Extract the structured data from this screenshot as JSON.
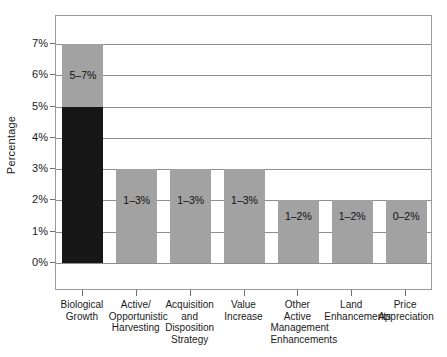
{
  "chart_data": {
    "type": "bar",
    "title": "",
    "subtitle": "",
    "xlabel": "",
    "ylabel": "Percentage",
    "ylim": [
      0,
      7
    ],
    "ytick_labels": [
      "0%",
      "1%",
      "2%",
      "3%",
      "4%",
      "5%",
      "6%",
      "7%"
    ],
    "ytick_values": [
      0,
      1,
      2,
      3,
      4,
      5,
      6,
      7
    ],
    "grid": true,
    "legend": "none",
    "stacked": true,
    "colors": {
      "light_gray": "#a2a2a2",
      "dark": "#171717",
      "gridline": "#8e8e8e",
      "frame": "#9a9a9a",
      "text": "#1a1a1a"
    },
    "categories": [
      "Biological Growth",
      "Active/ Opportunistic Harvesting",
      "Acquisition and Disposition Strategy",
      "Value Increase",
      "Other Active Management Enhancements",
      "Land Enhancements",
      "Price Appreciation"
    ],
    "category_lines": [
      [
        "Biological",
        "Growth"
      ],
      [
        "Active/",
        "Opportunistic",
        "Harvesting"
      ],
      [
        "Acquisition",
        "and",
        "Disposition",
        "Strategy"
      ],
      [
        "Value",
        "Increase"
      ],
      [
        "Other",
        "Active",
        "Management",
        "Enhancements"
      ],
      [
        "Land",
        "Enhancements"
      ],
      [
        "Price",
        "Appreciation"
      ]
    ],
    "bars": [
      {
        "category": "Biological Growth",
        "low": 5,
        "high": 7,
        "top": 7,
        "label": "5–7%",
        "has_dark_base": true,
        "dark_base_top": 5
      },
      {
        "category": "Active/ Opportunistic Harvesting",
        "low": 1,
        "high": 3,
        "top": 3,
        "label": "1–3%",
        "has_dark_base": false,
        "dark_base_top": 0
      },
      {
        "category": "Acquisition and Disposition Strategy",
        "low": 1,
        "high": 3,
        "top": 3,
        "label": "1–3%",
        "has_dark_base": false,
        "dark_base_top": 0
      },
      {
        "category": "Value Increase",
        "low": 1,
        "high": 3,
        "top": 3,
        "label": "1–3%",
        "has_dark_base": false,
        "dark_base_top": 0
      },
      {
        "category": "Other Active Management Enhancements",
        "low": 1,
        "high": 2,
        "top": 2,
        "label": "1–2%",
        "has_dark_base": false,
        "dark_base_top": 0
      },
      {
        "category": "Land Enhancements",
        "low": 1,
        "high": 2,
        "top": 2,
        "label": "1–2%",
        "has_dark_base": false,
        "dark_base_top": 0
      },
      {
        "category": "Price Appreciation",
        "low": 0,
        "high": 2,
        "top": 2,
        "label": "0–2%",
        "has_dark_base": false,
        "dark_base_top": 0
      }
    ],
    "bar_label_positions": [
      6,
      2,
      2,
      2,
      1.5,
      1.5,
      1.5
    ]
  }
}
